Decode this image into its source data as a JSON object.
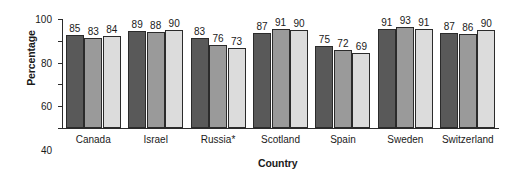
{
  "chart_data": {
    "type": "bar",
    "title": "",
    "xlabel": "Country",
    "ylabel": "Percentage",
    "ylim": [
      0,
      100
    ],
    "yticks": [
      0,
      20,
      40,
      60,
      80,
      100
    ],
    "grid": false,
    "legend": "none",
    "categories": [
      "Canada",
      "Israel",
      "Russia*",
      "Scotland",
      "Spain",
      "Sweden",
      "Switzerland"
    ],
    "series": [
      {
        "name": "series-1",
        "color": "#595959",
        "values": [
          85,
          89,
          83,
          87,
          75,
          91,
          87
        ]
      },
      {
        "name": "series-2",
        "color": "#9a9a9a",
        "values": [
          83,
          88,
          76,
          91,
          72,
          93,
          86
        ]
      },
      {
        "name": "series-3",
        "color": "#dcdcdc",
        "values": [
          84,
          90,
          73,
          90,
          69,
          91,
          90
        ]
      }
    ],
    "annotations": [
      "*"
    ]
  },
  "colors": {
    "axis": "#2b2b2b",
    "background": "#ffffff",
    "bar_dark": "#595959",
    "bar_medium": "#9a9a9a",
    "bar_light": "#dcdcdc"
  }
}
